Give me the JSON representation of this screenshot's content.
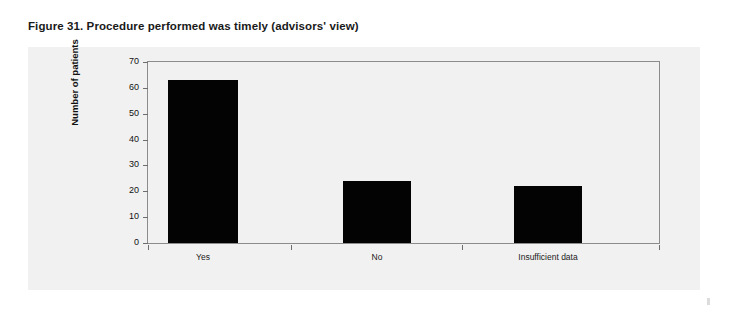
{
  "figure": {
    "caption": "Figure 31. Procedure performed was timely (advisors' view)"
  },
  "chart_data": {
    "type": "bar",
    "title": "Figure 31. Procedure performed was timely (advisors' view)",
    "categories": [
      "Yes",
      "No",
      "Insufficient data"
    ],
    "values": [
      63,
      24,
      22
    ],
    "series": [
      {
        "name": "Number of patients",
        "values": [
          63,
          24,
          22
        ]
      }
    ],
    "xlabel": "",
    "ylabel": "Number of patients",
    "ylim": [
      0,
      70
    ],
    "ytick_values": [
      0,
      10,
      20,
      30,
      40,
      50,
      60,
      70
    ],
    "ytick_labels": [
      "0",
      "10",
      "20",
      "30",
      "40",
      "50",
      "60",
      "70"
    ],
    "ytick_step": 10,
    "grid": false,
    "legend": false,
    "bar_color": "#030303",
    "plot_background": "#f1f1f1",
    "axis_color": "#8c8c8c"
  },
  "axes": {
    "y_title": "Number of patients",
    "y_labels": [
      "70",
      "60",
      "50",
      "40",
      "30",
      "20",
      "10",
      "0"
    ],
    "x_labels": [
      "Yes",
      "No",
      "Insufficient data"
    ]
  }
}
